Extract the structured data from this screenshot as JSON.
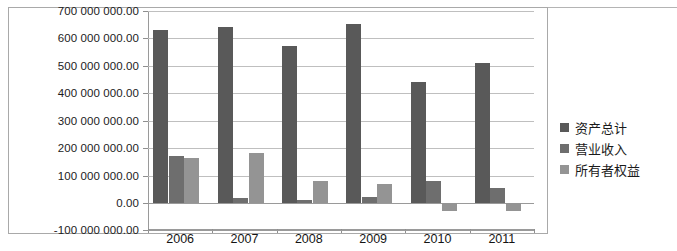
{
  "chart_data": {
    "type": "bar",
    "title": "",
    "xlabel": "",
    "ylabel": "",
    "categories": [
      "2006",
      "2007",
      "2008",
      "2009",
      "2010",
      "2011"
    ],
    "series": [
      {
        "name": "资产总计",
        "color": "#595959",
        "values": [
          632000000,
          641000000,
          572000000,
          652000000,
          441000000,
          509000000
        ]
      },
      {
        "name": "营业收入",
        "color": "#6e6e6e",
        "values": [
          172000000,
          18000000,
          12000000,
          22000000,
          80000000,
          53000000
        ]
      },
      {
        "name": "所有者权益",
        "color": "#949494",
        "values": [
          163000000,
          182000000,
          80000000,
          70000000,
          -30000000,
          -28000000
        ]
      }
    ],
    "ylim": [
      -100000000,
      700000000
    ],
    "ytick_step": 100000000,
    "ytick_labels": [
      "700 000 000.00",
      "600 000 000.00",
      "500 000 000.00",
      "400 000 000.00",
      "300 000 000.00",
      "200 000 000.00",
      "100 000 000.00",
      "0.00",
      "-100 000 000.00"
    ],
    "ytick_values": [
      700000000,
      600000000,
      500000000,
      400000000,
      300000000,
      200000000,
      100000000,
      0,
      -100000000
    ],
    "grid": true,
    "legend_position": "right"
  },
  "legend": {
    "items": [
      {
        "label": "资产总计",
        "color": "#595959"
      },
      {
        "label": "营业收入",
        "color": "#6e6e6e"
      },
      {
        "label": "所有者权益",
        "color": "#949494"
      }
    ]
  }
}
